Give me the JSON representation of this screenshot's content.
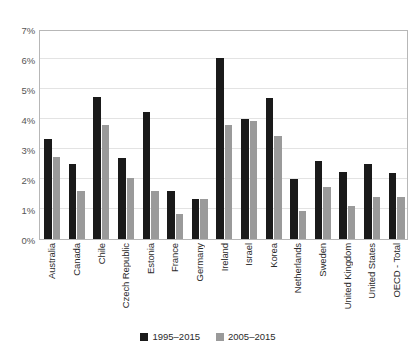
{
  "chart_data": {
    "type": "bar",
    "title": "",
    "subtitle": "",
    "xlabel": "",
    "ylabel": "",
    "ylim": [
      0,
      7
    ],
    "ytick_labels": [
      "0%",
      "1%",
      "2%",
      "3%",
      "4%",
      "5%",
      "6%",
      "7%"
    ],
    "ytick_values": [
      0,
      1,
      2,
      3,
      4,
      5,
      6,
      7
    ],
    "grid": true,
    "legend_position": "bottom",
    "categories": [
      "Australia",
      "Canada",
      "Chile",
      "Czech Republic",
      "Estonia",
      "France",
      "Germany",
      "Ireland",
      "Israel",
      "Korea",
      "Netherlands",
      "Sweden",
      "United Kingdom",
      "United States",
      "OECD - Total"
    ],
    "series": [
      {
        "name": "1995–2015",
        "color": "#1a1a1a",
        "values": [
          3.35,
          2.5,
          4.75,
          2.7,
          4.25,
          1.6,
          1.35,
          6.05,
          4.0,
          4.7,
          2.0,
          2.6,
          2.25,
          2.5,
          2.2
        ]
      },
      {
        "name": "2005–2015",
        "color": "#9a9a9a",
        "values": [
          2.75,
          1.6,
          3.8,
          2.05,
          1.6,
          0.85,
          1.35,
          3.8,
          3.95,
          3.45,
          0.95,
          1.75,
          1.1,
          1.4,
          1.4
        ]
      }
    ]
  },
  "legend": {
    "items": [
      {
        "label": "1995–2015",
        "color": "#1a1a1a"
      },
      {
        "label": "2005–2015",
        "color": "#9a9a9a"
      }
    ]
  },
  "colors": {
    "series_1995": "#1a1a1a",
    "series_2005": "#9a9a9a",
    "gridline": "#e3e3e3",
    "axis_border": "#b7b7b7",
    "background": "#ffffff",
    "tick_text": "#555555",
    "category_text": "#2b2b2b"
  }
}
